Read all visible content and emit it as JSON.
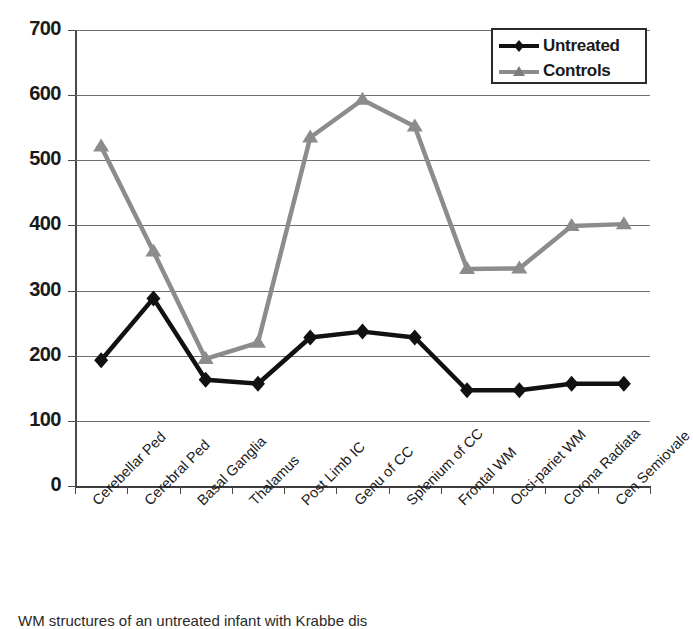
{
  "chart_data": {
    "type": "line",
    "title": "",
    "xlabel": "",
    "ylabel": "",
    "ylim": [
      0,
      700
    ],
    "ytick_step": 100,
    "yticks": [
      "700",
      "600",
      "500",
      "400",
      "300",
      "200",
      "100",
      "0"
    ],
    "grid": true,
    "legend_position": "top-right",
    "categories": [
      "Cerebellar Ped",
      "Cerebral Ped",
      "Basal Ganglia",
      "Thalamus",
      "Post Limb IC",
      "Genu of CC",
      "Splenium of CC",
      "Frontal WM",
      "Occi-pariet WM",
      "Corona Radiata",
      "Cen Semiovale"
    ],
    "series": [
      {
        "name": "Untreated",
        "color": "#111111",
        "marker": "diamond",
        "values": [
          193,
          288,
          163,
          157,
          228,
          237,
          228,
          147,
          147,
          157,
          157
        ]
      },
      {
        "name": "Controls",
        "color": "#8c8c8c",
        "marker": "triangle",
        "values": [
          521,
          360,
          195,
          220,
          535,
          593,
          552,
          333,
          334,
          399,
          402
        ]
      }
    ]
  },
  "legend": {
    "entries": [
      {
        "label": "Untreated"
      },
      {
        "label": "Controls"
      }
    ]
  },
  "caption": {
    "text": "WM structures of an untreated infant with Krabbe dis"
  }
}
